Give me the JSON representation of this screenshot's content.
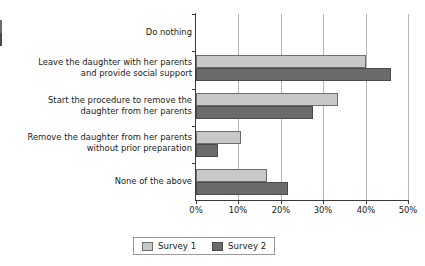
{
  "chart_data": {
    "type": "bar",
    "orientation": "horizontal",
    "title": "",
    "xlabel": "",
    "ylabel": "",
    "xlim": [
      0,
      50
    ],
    "xticks": [
      "0%",
      "10%",
      "20%",
      "30%",
      "40%",
      "50%"
    ],
    "xtick_values": [
      0,
      10,
      20,
      30,
      40,
      50
    ],
    "grid": "vertical",
    "legend_position": "bottom",
    "categories": [
      "Do nothing",
      "Leave the daughter with her parents and provide social support",
      "Start the procedure to remove the daughter from her parents",
      "Remove the daughter from her parents without prior preparation",
      "None of the above"
    ],
    "category_lines": [
      [
        "Do nothing"
      ],
      [
        "Leave the daughter with her parents",
        "and provide social support"
      ],
      [
        "Start the procedure to remove the",
        "daughter from her parents"
      ],
      [
        "Remove the daughter from her parents",
        "without prior preparation"
      ],
      [
        "None of the above"
      ]
    ],
    "series": [
      {
        "name": "Survey 1",
        "color": "#c8c8c8",
        "values": [
          0,
          40,
          33.5,
          10.6,
          16.7
        ]
      },
      {
        "name": "Survey 2",
        "color": "#6b6b6b",
        "values": [
          0,
          46,
          27.5,
          5.3,
          21.8
        ]
      }
    ]
  },
  "legend": {
    "items": [
      {
        "label": "Survey 1",
        "color": "#c8c8c8"
      },
      {
        "label": "Survey 2",
        "color": "#6b6b6b"
      }
    ]
  }
}
